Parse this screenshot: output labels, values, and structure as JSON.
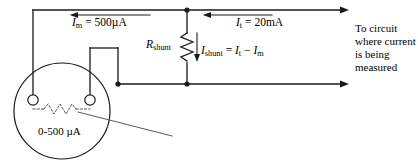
{
  "diagram": {
    "stroke_color": "#1a1a1a",
    "text_color": "#000000",
    "background": "#ffffff",
    "labels": {
      "meter_current": {
        "symbol": "I",
        "subscript": "m",
        "equals": " = 500",
        "unit": "µA"
      },
      "total_current": {
        "symbol": "I",
        "subscript": "t",
        "equals": " = 20",
        "unit": "mA"
      },
      "shunt_resistor": {
        "symbol": "R",
        "subscript": "shunt"
      },
      "shunt_current": {
        "symbol": "I",
        "subscript": "shunt",
        "equals": " = ",
        "term1": "I",
        "term1_sub": "t",
        "minus": " − ",
        "term2": "I",
        "term2_sub": "m"
      },
      "to_circuit": {
        "line1": "To circuit",
        "line2": "where current",
        "line3": "is being",
        "line4": "measured"
      },
      "meter_range": {
        "text": "0-500",
        "unit": "µA"
      }
    }
  }
}
